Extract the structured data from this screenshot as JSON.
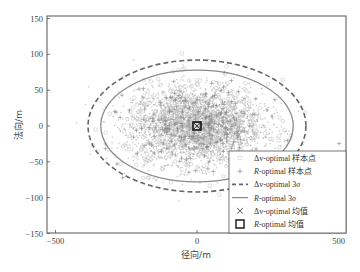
{
  "chart_data": {
    "type": "scatter",
    "title": "",
    "xlabel": "径向/m",
    "ylabel": "法向/m",
    "xlim": [
      -520,
      520
    ],
    "ylim": [
      -150,
      150
    ],
    "xticks": [
      -500,
      0,
      500
    ],
    "yticks": [
      150,
      100,
      50,
      0,
      -50,
      -100,
      -150
    ],
    "grid": false,
    "legend_position": "lower right (inside)",
    "legend": [
      {
        "label_prefix": "Δv",
        "label_suffix": "-optimal 样本点",
        "marker": "circle",
        "style": "light gray circles"
      },
      {
        "label_prefix": "R",
        "label_suffix": "-optimal 样本点",
        "marker": "plus",
        "style": "gray plus"
      },
      {
        "label_prefix": "Δv",
        "label_suffix": "-optimal 3σ",
        "marker": "dashed-line",
        "style": "dashed dark gray ellipse"
      },
      {
        "label_prefix": "R",
        "label_suffix": "-optimal 3σ",
        "marker": "solid-line",
        "style": "solid gray ellipse"
      },
      {
        "label_prefix": "Δv",
        "label_suffix": "-optimal 均值",
        "marker": "x",
        "style": "cross"
      },
      {
        "label_prefix": "R",
        "label_suffix": "-optimal 均值",
        "marker": "square",
        "style": "open black square"
      }
    ],
    "series": [
      {
        "name": "Δv-optimal 样本点",
        "kind": "scatter-cloud",
        "center": [
          0,
          0
        ],
        "approx_spread_3sigma": [
          385,
          92
        ]
      },
      {
        "name": "R-optimal 样本点",
        "kind": "scatter-cloud",
        "center": [
          0,
          0
        ],
        "approx_spread_3sigma": [
          340,
          78
        ]
      },
      {
        "name": "Δv-optimal 3σ",
        "kind": "ellipse",
        "center": [
          0,
          0
        ],
        "semi_axes": [
          385,
          92
        ]
      },
      {
        "name": "R-optimal 3σ",
        "kind": "ellipse",
        "center": [
          0,
          0
        ],
        "semi_axes": [
          340,
          78
        ]
      },
      {
        "name": "Δv-optimal 均值",
        "kind": "point",
        "x": 0,
        "y": 0
      },
      {
        "name": "R-optimal 均值",
        "kind": "point",
        "x": 0,
        "y": 0
      }
    ]
  },
  "colors": {
    "cloud": "#9a9a9a",
    "cloud_light": "#c8c8c8",
    "dashed_ellipse": "#666666",
    "solid_ellipse": "#888888",
    "axis": "#555555"
  }
}
